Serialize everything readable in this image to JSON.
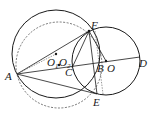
{
  "diagram": {
    "type": "geometry",
    "stroke_color": "#1a1a1a",
    "dashed_color": "#555555",
    "points": {
      "A": {
        "label": "A",
        "x": 17,
        "y": 74
      },
      "F": {
        "label": "F",
        "x": 89,
        "y": 31
      },
      "E": {
        "label": "E",
        "x": 97,
        "y": 94
      },
      "B": {
        "label": "B",
        "x": 96,
        "y": 63
      },
      "O": {
        "label": "O",
        "x": 106,
        "y": 61
      },
      "D": {
        "label": "D",
        "x": 140,
        "y": 57
      },
      "C": {
        "label": "C",
        "x": 72,
        "y": 68
      },
      "O1": {
        "label": "O",
        "sub": "1",
        "x": 56,
        "y": 54
      },
      "O2": {
        "label": "O",
        "sub": "2",
        "x": 59,
        "y": 65
      }
    },
    "circles": [
      {
        "name": "circle-O",
        "cx": 106,
        "cy": 61,
        "r": 34,
        "style": "solid"
      },
      {
        "name": "circle-O1",
        "cx": 56,
        "cy": 54,
        "r": 44,
        "style": "solid"
      },
      {
        "name": "circle-O2",
        "cx": 59,
        "cy": 65,
        "r": 43,
        "style": "dashed"
      }
    ],
    "segments": [
      "AF",
      "AE",
      "AD",
      "FE",
      "FO",
      "AO1"
    ]
  }
}
